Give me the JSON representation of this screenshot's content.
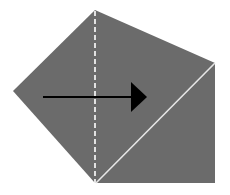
{
  "diagram": {
    "colors": {
      "background": "#ffffff",
      "shape_fill": "#6b6b6b",
      "fold_line": "#ffffff",
      "crease_line": "#e6e6e6",
      "arrow": "#000000"
    },
    "shape": {
      "vertices": [
        [
          95,
          10
        ],
        [
          215,
          63
        ],
        [
          215,
          183
        ],
        [
          95,
          183
        ],
        [
          13,
          91
        ]
      ]
    },
    "fold_line": {
      "x1": 95,
      "y1": 10,
      "x2": 95,
      "y2": 183,
      "style": "dashed"
    },
    "crease_line": {
      "x1": 95,
      "y1": 183,
      "x2": 215,
      "y2": 63,
      "style": "solid"
    },
    "arrow": {
      "x1": 43,
      "y1": 97,
      "x2": 147,
      "y2": 97,
      "direction": "right",
      "icon": "arrow-right-icon"
    }
  }
}
